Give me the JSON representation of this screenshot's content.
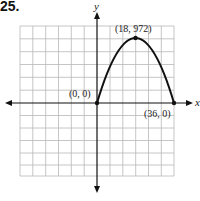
{
  "problem_number": "25.",
  "axes": {
    "x_label": "x",
    "y_label": "y"
  },
  "points": [
    {
      "label": "(0, 0)",
      "x": 0,
      "y": 0
    },
    {
      "label": "(18, 972)",
      "x": 18,
      "y": 972
    },
    {
      "label": "(36, 0)",
      "x": 36,
      "y": 0
    }
  ],
  "curve": {
    "type": "parabola",
    "vertex": [
      18,
      972
    ],
    "x_intercepts": [
      0,
      36
    ],
    "domain": [
      0,
      36
    ]
  },
  "grid": {
    "columns": 12,
    "rows": 12
  },
  "colors": {
    "grid": "#b8b8b8",
    "curve": "#111111",
    "axes": "#111111"
  }
}
